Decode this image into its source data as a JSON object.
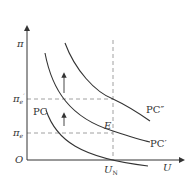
{
  "diagram": {
    "type": "phillips-curve-shift",
    "axes": {
      "y_label": "π",
      "x_label": "U",
      "origin_label": "O"
    },
    "y_ticks": [
      {
        "label": "π",
        "sub": "e",
        "prime": "′",
        "name": "expected-inflation-2"
      },
      {
        "label": "π",
        "sub": "e",
        "prime": "",
        "name": "expected-inflation-1"
      }
    ],
    "x_ticks": [
      {
        "label": "U",
        "sub": "N",
        "name": "natural-unemployment"
      }
    ],
    "point": {
      "label": "E"
    },
    "curves": [
      {
        "label": "PC"
      },
      {
        "label": "PC′"
      },
      {
        "label": "PC″"
      }
    ],
    "colors": {
      "line": "#333333",
      "dashed": "#777777"
    }
  }
}
